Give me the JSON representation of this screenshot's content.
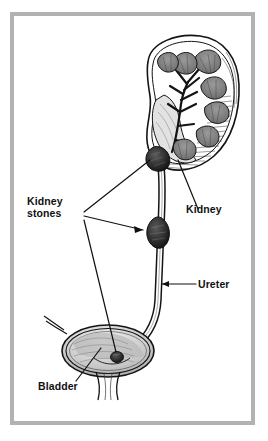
{
  "figure": {
    "style": "pen-and-ink medical illustration",
    "frame_color": "#b2b2b2",
    "background_color": "#ffffff",
    "ink_color": "#111111"
  },
  "labels": {
    "kidney_stones": "Kidney\nstones",
    "kidney": "Kidney",
    "ureter": "Ureter",
    "bladder": "Bladder"
  },
  "anatomy": {
    "kidney": "right kidney shown in coronal cross-section with cortex, renal pyramids and calyces",
    "ureter": "long tube descending from renal pelvis to bladder",
    "bladder": "urinary bladder shown as shaded oval with urethra below",
    "stones": [
      {
        "name": "renal-pelvis-stone",
        "location": "renal pelvis"
      },
      {
        "name": "ureter-stone",
        "location": "mid ureter"
      },
      {
        "name": "bladder-stone",
        "location": "bladder"
      }
    ]
  }
}
